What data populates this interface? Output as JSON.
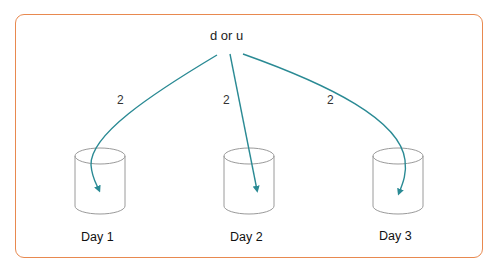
{
  "diagram": {
    "frame_color": "#e8894f",
    "arrow_color": "#2a8a94",
    "source_node": {
      "label": "d or u"
    },
    "edges": [
      {
        "from": "d or u",
        "to": "Day 1",
        "label": "2"
      },
      {
        "from": "d or u",
        "to": "Day 2",
        "label": "2"
      },
      {
        "from": "d or u",
        "to": "Day 3",
        "label": "2"
      }
    ],
    "targets": [
      {
        "label": "Day 1",
        "icon": "database-cylinder-icon"
      },
      {
        "label": "Day 2",
        "icon": "database-cylinder-icon"
      },
      {
        "label": "Day 3",
        "icon": "database-cylinder-icon"
      }
    ]
  }
}
